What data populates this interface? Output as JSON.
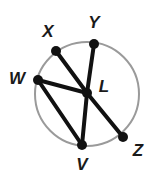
{
  "figure": {
    "kind": "circle-geometry-diagram",
    "background_color": "#ffffff"
  },
  "chart_data": {
    "type": "scatter",
    "xlabel": "",
    "ylabel": "",
    "xlim": [
      0,
      158
    ],
    "ylim": [
      0,
      180
    ],
    "grid": false,
    "legend": "none",
    "circle": {
      "center_label": "L",
      "cx": 87,
      "cy": 94,
      "r": 52,
      "stroke_color": "#9a9a9a",
      "stroke_width": 2,
      "fill": "none"
    },
    "points": [
      {
        "name": "X",
        "x": 56,
        "y": 51,
        "label": "X",
        "label_x": 48,
        "label_y": 33,
        "on_circle": true
      },
      {
        "name": "Y",
        "x": 94,
        "y": 44,
        "label": "Y",
        "label_x": 94,
        "label_y": 24,
        "on_circle": true
      },
      {
        "name": "W",
        "x": 38,
        "y": 80,
        "label": "W",
        "label_x": 17,
        "label_y": 80,
        "on_circle": true
      },
      {
        "name": "L",
        "x": 87,
        "y": 93,
        "label": "L",
        "label_x": 104,
        "label_y": 88,
        "on_circle": false
      },
      {
        "name": "V",
        "x": 82,
        "y": 145,
        "label": "V",
        "label_x": 82,
        "label_y": 166,
        "on_circle": true
      },
      {
        "name": "Z",
        "x": 123,
        "y": 137,
        "label": "Z",
        "label_x": 138,
        "label_y": 152,
        "on_circle": true
      }
    ],
    "point_marker": {
      "radius": 5,
      "color": "#111111"
    },
    "segments": [
      {
        "name": "segment-X-L",
        "from": "X",
        "to": "L",
        "x1": 56,
        "y1": 51,
        "x2": 87,
        "y2": 93
      },
      {
        "name": "segment-Y-L",
        "from": "Y",
        "to": "L",
        "x1": 94,
        "y1": 44,
        "x2": 87,
        "y2": 93
      },
      {
        "name": "segment-W-L",
        "from": "W",
        "to": "L",
        "x1": 38,
        "y1": 80,
        "x2": 87,
        "y2": 93
      },
      {
        "name": "segment-W-V",
        "from": "W",
        "to": "V",
        "x1": 38,
        "y1": 80,
        "x2": 82,
        "y2": 145
      },
      {
        "name": "segment-V-L",
        "from": "V",
        "to": "L",
        "x1": 82,
        "y1": 145,
        "x2": 87,
        "y2": 93
      },
      {
        "name": "segment-L-Z",
        "from": "L",
        "to": "Z",
        "x1": 87,
        "y1": 93,
        "x2": 123,
        "y2": 137
      }
    ],
    "segment_style": {
      "color": "#111111",
      "width": 4
    },
    "labels": [
      "X",
      "Y",
      "W",
      "L",
      "V",
      "Z"
    ]
  }
}
